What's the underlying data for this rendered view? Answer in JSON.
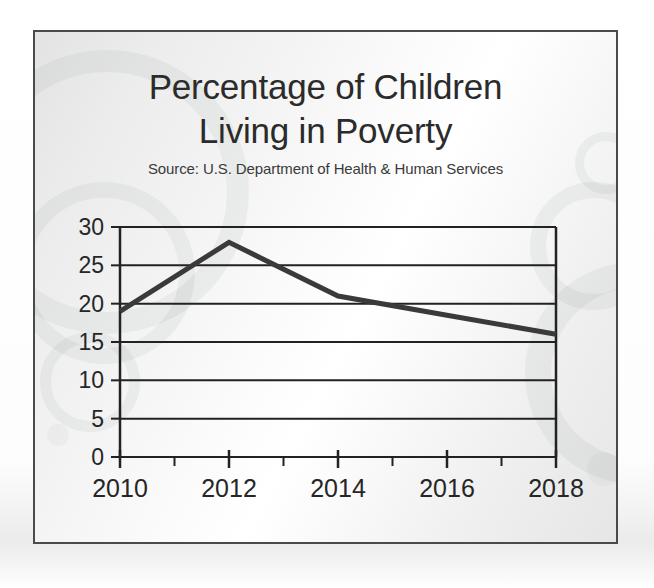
{
  "slide": {
    "title_lines": [
      "Percentage of Children",
      "Living in Poverty"
    ],
    "source": "Source: U.S. Department of Health & Human Services",
    "frame_color": "#4a4a4a",
    "background_color": "#eeeeee"
  },
  "chart_data": {
    "type": "line",
    "title": "Percentage of Children Living in Poverty",
    "subtitle": "Source: U.S. Department of Health & Human Services",
    "xlabel": "",
    "ylabel": "",
    "x": [
      2010,
      2012,
      2014,
      2016,
      2018
    ],
    "values": [
      19,
      28,
      21,
      18.5,
      16
    ],
    "series": [
      {
        "name": "Percentage of children living in poverty",
        "values": [
          19,
          28,
          21,
          18.5,
          16
        ]
      }
    ],
    "xlim": [
      2010,
      2018
    ],
    "ylim": [
      0,
      30
    ],
    "ytick_labels": [
      "0",
      "5",
      "10",
      "15",
      "20",
      "25",
      "30"
    ],
    "ytick_values": [
      0,
      5,
      10,
      15,
      20,
      25,
      30
    ],
    "xtick_labels": [
      "2010",
      "2012",
      "2014",
      "2016",
      "2018"
    ],
    "xtick_values": [
      2010,
      2012,
      2014,
      2016,
      2018
    ],
    "x_minor_ticks": [
      2011,
      2013,
      2015,
      2017
    ],
    "grid": "horizontal",
    "legend": "none",
    "line_color": "#3a3a3a",
    "line_width": 5,
    "axis_color": "#222222"
  }
}
